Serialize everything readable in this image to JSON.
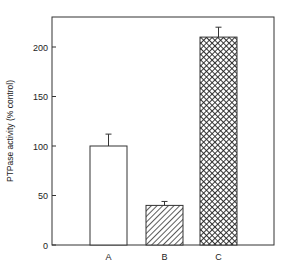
{
  "chart_data": {
    "type": "bar",
    "title": "",
    "xlabel": "",
    "ylabel": "PTPase activity (% control)",
    "categories": [
      "A",
      "B",
      "C"
    ],
    "values": [
      100,
      40,
      210
    ],
    "errors": [
      12,
      4,
      10
    ],
    "patterns": [
      "open",
      "diagonal-hatch",
      "crosshatch"
    ],
    "ylim": [
      0,
      232
    ],
    "yticks": [
      0,
      50,
      100,
      150,
      200
    ],
    "ytick_labels": [
      "0",
      "50",
      "100",
      "150",
      "200"
    ],
    "grid": false,
    "legend": "none",
    "frame": "boxed",
    "colors": {
      "ink": "#333333",
      "fill": "#ffffff"
    }
  }
}
